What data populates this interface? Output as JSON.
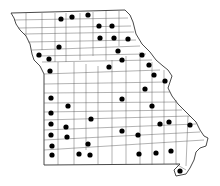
{
  "map": {
    "region": "Missouri",
    "subdivision": "counties",
    "marker_color": "#000000",
    "outline_color": "#333333",
    "background": "#ffffff",
    "marker_count": 43,
    "markers": [
      {
        "x": 61,
        "y": 19
      },
      {
        "x": 72,
        "y": 17
      },
      {
        "x": 88,
        "y": 15
      },
      {
        "x": 99,
        "y": 26
      },
      {
        "x": 112,
        "y": 26
      },
      {
        "x": 100,
        "y": 38
      },
      {
        "x": 114,
        "y": 38
      },
      {
        "x": 128,
        "y": 39
      },
      {
        "x": 59,
        "y": 47
      },
      {
        "x": 118,
        "y": 51
      },
      {
        "x": 39,
        "y": 55
      },
      {
        "x": 49,
        "y": 59
      },
      {
        "x": 122,
        "y": 60
      },
      {
        "x": 142,
        "y": 55
      },
      {
        "x": 50,
        "y": 71
      },
      {
        "x": 109,
        "y": 67
      },
      {
        "x": 149,
        "y": 65
      },
      {
        "x": 154,
        "y": 75
      },
      {
        "x": 165,
        "y": 81
      },
      {
        "x": 145,
        "y": 89
      },
      {
        "x": 51,
        "y": 98
      },
      {
        "x": 122,
        "y": 99
      },
      {
        "x": 68,
        "y": 106
      },
      {
        "x": 152,
        "y": 106
      },
      {
        "x": 51,
        "y": 113
      },
      {
        "x": 91,
        "y": 119
      },
      {
        "x": 51,
        "y": 124
      },
      {
        "x": 66,
        "y": 127
      },
      {
        "x": 160,
        "y": 124
      },
      {
        "x": 169,
        "y": 122
      },
      {
        "x": 190,
        "y": 125
      },
      {
        "x": 122,
        "y": 131
      },
      {
        "x": 51,
        "y": 135
      },
      {
        "x": 67,
        "y": 137
      },
      {
        "x": 138,
        "y": 135
      },
      {
        "x": 88,
        "y": 144
      },
      {
        "x": 52,
        "y": 146
      },
      {
        "x": 171,
        "y": 151
      },
      {
        "x": 52,
        "y": 155
      },
      {
        "x": 79,
        "y": 154
      },
      {
        "x": 90,
        "y": 155
      },
      {
        "x": 139,
        "y": 154
      },
      {
        "x": 156,
        "y": 153
      },
      {
        "x": 180,
        "y": 171
      }
    ]
  }
}
